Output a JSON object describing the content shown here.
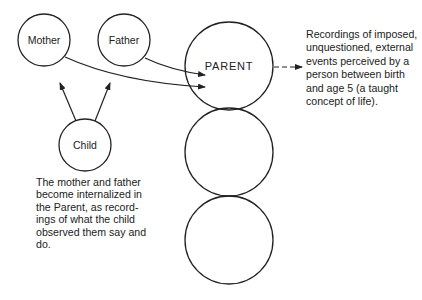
{
  "diagram": {
    "nodes": {
      "mother": {
        "label": "Mother"
      },
      "father": {
        "label": "Father"
      },
      "child": {
        "label": "Child"
      },
      "parent": {
        "label": "PARENT"
      },
      "adult": {
        "label": ""
      },
      "child_state": {
        "label": ""
      }
    },
    "edges": [
      {
        "from": "mother",
        "to": "parent",
        "style": "solid-arrow"
      },
      {
        "from": "father",
        "to": "parent",
        "style": "solid-arrow"
      },
      {
        "from": "child",
        "to": "mother",
        "style": "solid-arrow"
      },
      {
        "from": "child",
        "to": "father",
        "style": "solid-arrow"
      },
      {
        "from": "parent",
        "to": "description",
        "style": "dashed-arrow"
      }
    ],
    "descriptions": {
      "parent": "Recordings of imposed,\nunquestioned, external\nevents perceived by a\nperson between birth\nand age 5 (a taught\nconcept of life).",
      "child": "The mother and father\nbecome internalized in\nthe Parent, as record-\nings of what the child\nobserved them say and\ndo."
    },
    "colors": {
      "stroke": "#222222",
      "background": "#ffffff"
    }
  }
}
